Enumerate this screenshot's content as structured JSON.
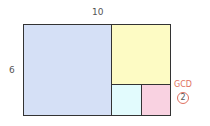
{
  "diagram": {
    "width_label": "10",
    "height_label": "6",
    "gcd_label": "GCD",
    "gcd_value": "2",
    "regions": [
      {
        "name": "square-6x6",
        "color": "#d5e0f6"
      },
      {
        "name": "square-4x4",
        "color": "#fdfbc4"
      },
      {
        "name": "square-2x2-a",
        "color": "#e2fbfd"
      },
      {
        "name": "square-2x2-b",
        "color": "#f9d2e1"
      }
    ],
    "accent": "#e07060"
  }
}
